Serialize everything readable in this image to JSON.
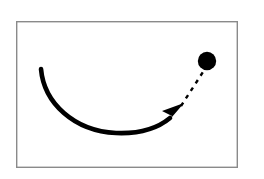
{
  "figure": {
    "name": "curved-arrow-trajectory-diagram",
    "background_color": "#ffffff",
    "width": 264,
    "height": 179
  },
  "frame": {
    "name": "diagram-border-frame",
    "x": 16,
    "y": 21,
    "width": 222,
    "height": 147,
    "stroke_color": "#8a8a8a",
    "stroke_width": 1.4,
    "fill_color": "#ffffff"
  },
  "curved_arrow": {
    "name": "curved-arrow",
    "stroke_color": "#000000",
    "stroke_width": 4.6,
    "linecap": "round",
    "path": "M 41 69 C 44 103, 74 131, 116 133 C 140 134, 158 128, 170 118",
    "start_point": [
      41,
      69
    ],
    "lowest_point": [
      120,
      133
    ],
    "end_point": [
      170,
      118
    ]
  },
  "arrowhead": {
    "name": "arrowhead",
    "fill_color": "#000000",
    "tip_point": [
      184,
      103
    ],
    "points": "184,103 162,111 172,116 166,124",
    "direction_degrees": -45
  },
  "dashed_line": {
    "name": "dashed-connector-line",
    "stroke_color": "#000000",
    "stroke_width": 2.4,
    "dash_pattern": "4 5",
    "start_point": [
      181,
      106
    ],
    "end_point": [
      203,
      72
    ]
  },
  "dot": {
    "name": "target-dot",
    "fill_color": "#000000",
    "center_x": 207,
    "center_y": 61,
    "radius": 9.2
  }
}
